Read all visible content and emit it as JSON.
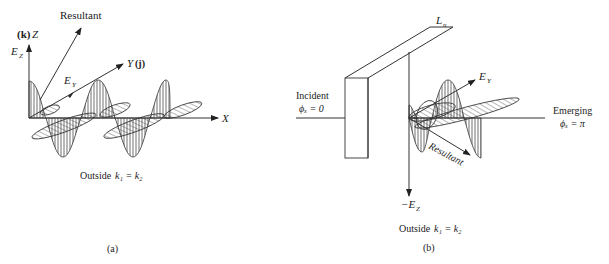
{
  "figure": {
    "panel_a": {
      "caption": "(a)",
      "subtitle_prefix": "Outside",
      "subtitle_eq": "k₁ = k₂",
      "labels": {
        "resultant": "Resultant",
        "z_axis_unit": "(k)",
        "z_axis": "Z",
        "ez": "E",
        "ez_sub": "Z",
        "ey": "E",
        "ey_sub": "Y",
        "y_axis": "Y",
        "y_axis_unit": "(j)",
        "x_axis": "X"
      }
    },
    "panel_b": {
      "caption": "(b)",
      "subtitle_prefix": "Outside",
      "subtitle_eq": "k₁ = k₂",
      "labels": {
        "slab": "L",
        "slab_sub": "n",
        "incident": "Incident",
        "incident_phase": "ϕₓ = 0",
        "emerging": "Emerging",
        "emerging_phase": "ϕₓ = π",
        "ey": "E",
        "ey_sub": "Y",
        "resultant": "Resultant",
        "neg_ez": "−E",
        "neg_ez_sub": "Z"
      }
    }
  }
}
